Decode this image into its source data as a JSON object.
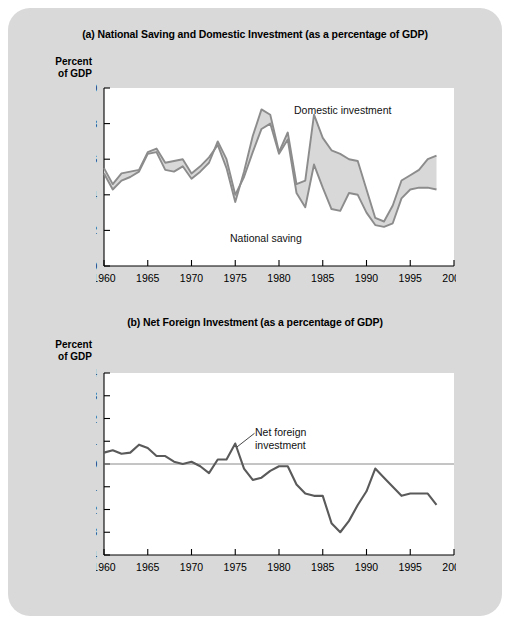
{
  "figure": {
    "background_color": "#d9d9d9",
    "plot_background_color": "#ffffff"
  },
  "panel_a": {
    "title": "(a) National Saving and Domestic Investment (as a percentage of GDP)",
    "axis_caption": "Percent\nof GDP",
    "label_domestic_investment": "Domestic investment",
    "label_national_saving": "National saving"
  },
  "panel_b": {
    "title": "(b) Net Foreign Investment (as a percentage of GDP)",
    "axis_caption": "Percent\nof GDP",
    "label_net_foreign_investment": "Net foreign\ninvestment"
  },
  "chart_data": [
    {
      "type": "line",
      "id": "panel-a",
      "title": "(a) National Saving and Domestic Investment (as a percentage of GDP)",
      "xlabel": "",
      "ylabel": "Percent of GDP",
      "xlim": [
        1960,
        2000
      ],
      "ylim": [
        10,
        20
      ],
      "xticks": [
        1960,
        1965,
        1970,
        1975,
        1980,
        1985,
        1990,
        1995,
        2000
      ],
      "yticks": [
        10,
        12,
        14,
        16,
        18,
        20
      ],
      "grid": false,
      "legend": "inline-annotations",
      "fill_between": true,
      "fill_color": "#d8d8d8",
      "line_color": "#8c8c8c",
      "x": [
        1960,
        1961,
        1962,
        1963,
        1964,
        1965,
        1966,
        1967,
        1968,
        1969,
        1970,
        1971,
        1972,
        1973,
        1974,
        1975,
        1976,
        1977,
        1978,
        1979,
        1980,
        1981,
        1982,
        1983,
        1984,
        1985,
        1986,
        1987,
        1988,
        1989,
        1990,
        1991,
        1992,
        1993,
        1994,
        1995,
        1996,
        1997,
        1998
      ],
      "series": [
        {
          "name": "Domestic investment",
          "values": [
            15.5,
            14.6,
            15.2,
            15.3,
            15.4,
            16.4,
            16.6,
            15.8,
            15.9,
            16.0,
            15.2,
            15.6,
            16.1,
            16.8,
            15.5,
            13.6,
            15.3,
            17.3,
            18.8,
            18.5,
            16.4,
            17.5,
            14.6,
            14.8,
            18.5,
            17.2,
            16.5,
            16.3,
            16.0,
            15.9,
            14.3,
            12.7,
            12.5,
            13.4,
            14.8,
            15.1,
            15.4,
            16.0,
            16.2
          ]
        },
        {
          "name": "National saving",
          "values": [
            15.2,
            14.3,
            14.8,
            15.0,
            15.3,
            16.3,
            16.4,
            15.4,
            15.3,
            15.6,
            14.9,
            15.3,
            15.8,
            17.0,
            16.0,
            14.0,
            15.0,
            16.4,
            17.7,
            18.0,
            16.3,
            17.1,
            14.1,
            13.3,
            15.7,
            14.4,
            13.2,
            13.1,
            14.1,
            14.0,
            13.0,
            12.3,
            12.2,
            12.4,
            13.8,
            14.3,
            14.4,
            14.4,
            14.3
          ]
        }
      ]
    },
    {
      "type": "line",
      "id": "panel-b",
      "title": "(b) Net Foreign Investment (as a percentage of GDP)",
      "xlabel": "",
      "ylabel": "Percent of GDP",
      "xlim": [
        1960,
        2000
      ],
      "ylim": [
        -4,
        4
      ],
      "xticks": [
        1960,
        1965,
        1970,
        1975,
        1980,
        1985,
        1990,
        1995,
        2000
      ],
      "yticks": [
        -4,
        -3,
        -2,
        -1,
        0,
        1,
        2,
        3,
        4
      ],
      "grid": false,
      "zero_line": true,
      "line_color": "#5a5a5a",
      "x": [
        1960,
        1961,
        1962,
        1963,
        1964,
        1965,
        1966,
        1967,
        1968,
        1969,
        1970,
        1971,
        1972,
        1973,
        1974,
        1975,
        1976,
        1977,
        1978,
        1979,
        1980,
        1981,
        1982,
        1983,
        1984,
        1985,
        1986,
        1987,
        1988,
        1989,
        1990,
        1991,
        1992,
        1993,
        1994,
        1995,
        1996,
        1997,
        1998
      ],
      "values": [
        0.5,
        0.6,
        0.45,
        0.5,
        0.85,
        0.7,
        0.35,
        0.35,
        0.1,
        0.0,
        0.1,
        -0.1,
        -0.4,
        0.2,
        0.2,
        0.9,
        -0.2,
        -0.7,
        -0.6,
        -0.3,
        -0.1,
        -0.1,
        -0.9,
        -1.3,
        -1.4,
        -1.4,
        -2.6,
        -3.0,
        -2.5,
        -1.8,
        -1.2,
        -0.2,
        -0.6,
        -1.0,
        -1.4,
        -1.3,
        -1.3,
        -1.3,
        -1.8
      ]
    }
  ],
  "colors": {
    "panel_background": "#d9d9d9",
    "plot_background": "#ffffff",
    "line_investment": "#8c8c8c",
    "line_saving": "#8c8c8c",
    "band_fill": "#d8d8d8",
    "line_net_foreign": "#5a5a5a",
    "axis": "#000000"
  }
}
